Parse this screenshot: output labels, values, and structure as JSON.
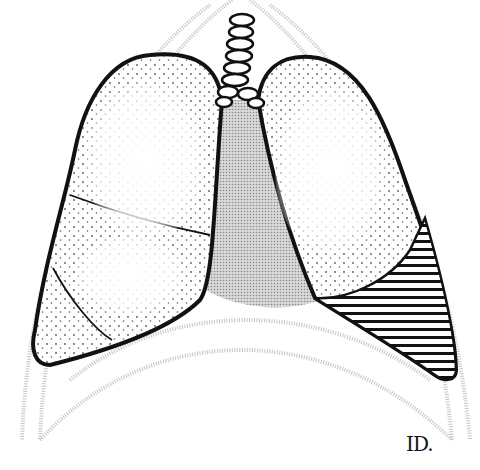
{
  "figure": {
    "signature": "ID.",
    "colors": {
      "outline": "#111111",
      "mediastinum": "#bdbdbd",
      "ribcage": "#c8c8c8",
      "stipple": "#222222",
      "hatch": "#111111",
      "background": "#ffffff"
    },
    "regions": [
      {
        "name": "right-lung-upper-lobe",
        "fill": "stipple"
      },
      {
        "name": "right-lung-middle-lobe",
        "fill": "stipple"
      },
      {
        "name": "right-lung-lower-lobe",
        "fill": "stipple"
      },
      {
        "name": "left-lung-upper-lobe",
        "fill": "stipple"
      },
      {
        "name": "left-lung-lower-lobe",
        "fill": "horizontal-hatch"
      },
      {
        "name": "mediastinum",
        "fill": "gray-screen"
      },
      {
        "name": "trachea",
        "fill": "rings"
      }
    ]
  }
}
